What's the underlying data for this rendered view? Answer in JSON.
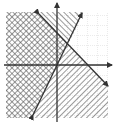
{
  "figure": {
    "type": "system-of-linear-inequalities-graph",
    "colors": {
      "background": "#ffffff",
      "line": "#333333",
      "axis": "#333333",
      "grid": "#bbbbbb",
      "hatch": "#555555"
    },
    "plot_box": {
      "left": 6,
      "top": 12,
      "right": 108,
      "bottom": 118
    },
    "axes": {
      "origin_px": {
        "x": 57,
        "y": 65
      },
      "x_axis": {
        "label": "",
        "arrow": "right"
      },
      "y_axis": {
        "label": "",
        "arrow": "up"
      },
      "grid_spacing_px": 10
    },
    "lines": [
      {
        "name": "boundary-line-1",
        "slope_sign": "positive",
        "from": {
          "x": 33,
          "y": 115
        },
        "to": {
          "x": 82,
          "y": 13
        },
        "style": "solid",
        "arrows": "both"
      },
      {
        "name": "boundary-line-2",
        "slope_sign": "negative",
        "from": {
          "x": 39,
          "y": 14
        },
        "to": {
          "x": 108,
          "y": 86
        },
        "style": "solid",
        "arrows": "both"
      }
    ],
    "regions": [
      {
        "name": "solution-region",
        "shading": "cross-hatch",
        "location": "left of both lines"
      },
      {
        "name": "line-1-only-region",
        "shading": "diagonal-hatch",
        "location": "top, between lines"
      },
      {
        "name": "line-2-only-region",
        "shading": "diagonal-hatch",
        "location": "bottom-right below line 2"
      },
      {
        "name": "unshaded-region",
        "shading": "none",
        "location": "top-right"
      }
    ]
  }
}
